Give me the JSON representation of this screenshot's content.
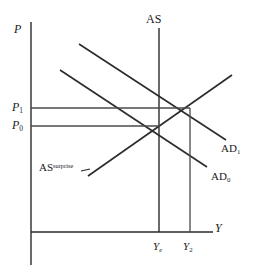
{
  "figure": {
    "background_color": "#ffffff",
    "line_color": "#2a2a2a",
    "text_color": "#1a1a1a"
  },
  "axes": {
    "y_axis_label": "P",
    "x_axis_label": "Y",
    "y_axis": {
      "x": 31,
      "y_top": 22,
      "y_bottom": 265
    },
    "x_axis": {
      "y": 232,
      "x_left": 31,
      "x_right": 213
    }
  },
  "price_levels": [
    {
      "name": "P1",
      "base": "P",
      "sub": "1",
      "value_y": 108,
      "line_x_end": 190
    },
    {
      "name": "P0",
      "base": "P",
      "sub": "0",
      "value_y": 126,
      "line_x_end": 160
    }
  ],
  "output_levels": [
    {
      "name": "Ye",
      "base": "Y",
      "sub": "e",
      "value_x": 160,
      "line_y_top": 127
    },
    {
      "name": "Y2",
      "base": "Y",
      "sub": "2",
      "value_x": 190,
      "line_y_top": 109
    }
  ],
  "curves": [
    {
      "id": "AS",
      "label": "AS",
      "type": "vertical",
      "description": "long-run aggregate supply, vertical at Ye",
      "x1": 159,
      "y1": 28,
      "x2": 159,
      "y2": 232
    },
    {
      "id": "AS-surprise",
      "label": "AS",
      "superscript": "surprise",
      "type": "upward-sloping",
      "description": "short-run aggregate supply with surprise, upward sloping",
      "x1": 88,
      "y1": 176,
      "x2": 232,
      "y2": 75
    },
    {
      "id": "AD1",
      "label": "AD",
      "subscript": "1",
      "type": "downward-sloping",
      "description": "higher aggregate demand curve",
      "x1": 79,
      "y1": 44,
      "x2": 226,
      "y2": 140
    },
    {
      "id": "AD0",
      "label": "AD",
      "subscript": "0",
      "type": "downward-sloping",
      "description": "initial aggregate demand curve",
      "x1": 60,
      "y1": 70,
      "x2": 207,
      "y2": 167
    }
  ],
  "equilibria": [
    {
      "id": "E0",
      "x": 160,
      "y": 126,
      "price": "P0",
      "output": "Ye"
    },
    {
      "id": "E1",
      "x": 190,
      "y": 108,
      "price": "P1",
      "output": "Y2"
    }
  ],
  "annotations": {
    "as_surprise_pointer": {
      "x1": 90,
      "y1": 170,
      "x2": 80,
      "y2": 172
    }
  }
}
